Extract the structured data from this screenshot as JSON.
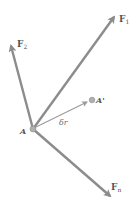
{
  "diagram": {
    "type": "force-vector-diagram",
    "colors": {
      "arrow": "#8c8c8c",
      "displacement": "#9a9a9a",
      "point": "#a8a8a8",
      "label": "#6a6a6a",
      "background": "#ffffff"
    },
    "point_A": {
      "label": "A",
      "x": 33,
      "y": 129
    },
    "point_A_prime": {
      "label": "A'",
      "x": 92,
      "y": 100
    },
    "displacement": {
      "label": "δr",
      "from": "A",
      "to": "A'"
    },
    "forces": [
      {
        "name": "F",
        "subscript": "1",
        "tip_x": 116,
        "tip_y": 14
      },
      {
        "name": "F",
        "subscript": "2",
        "tip_x": 10,
        "tip_y": 43
      },
      {
        "name": "F",
        "subscript": "n",
        "tip_x": 112,
        "tip_y": 198
      }
    ]
  }
}
